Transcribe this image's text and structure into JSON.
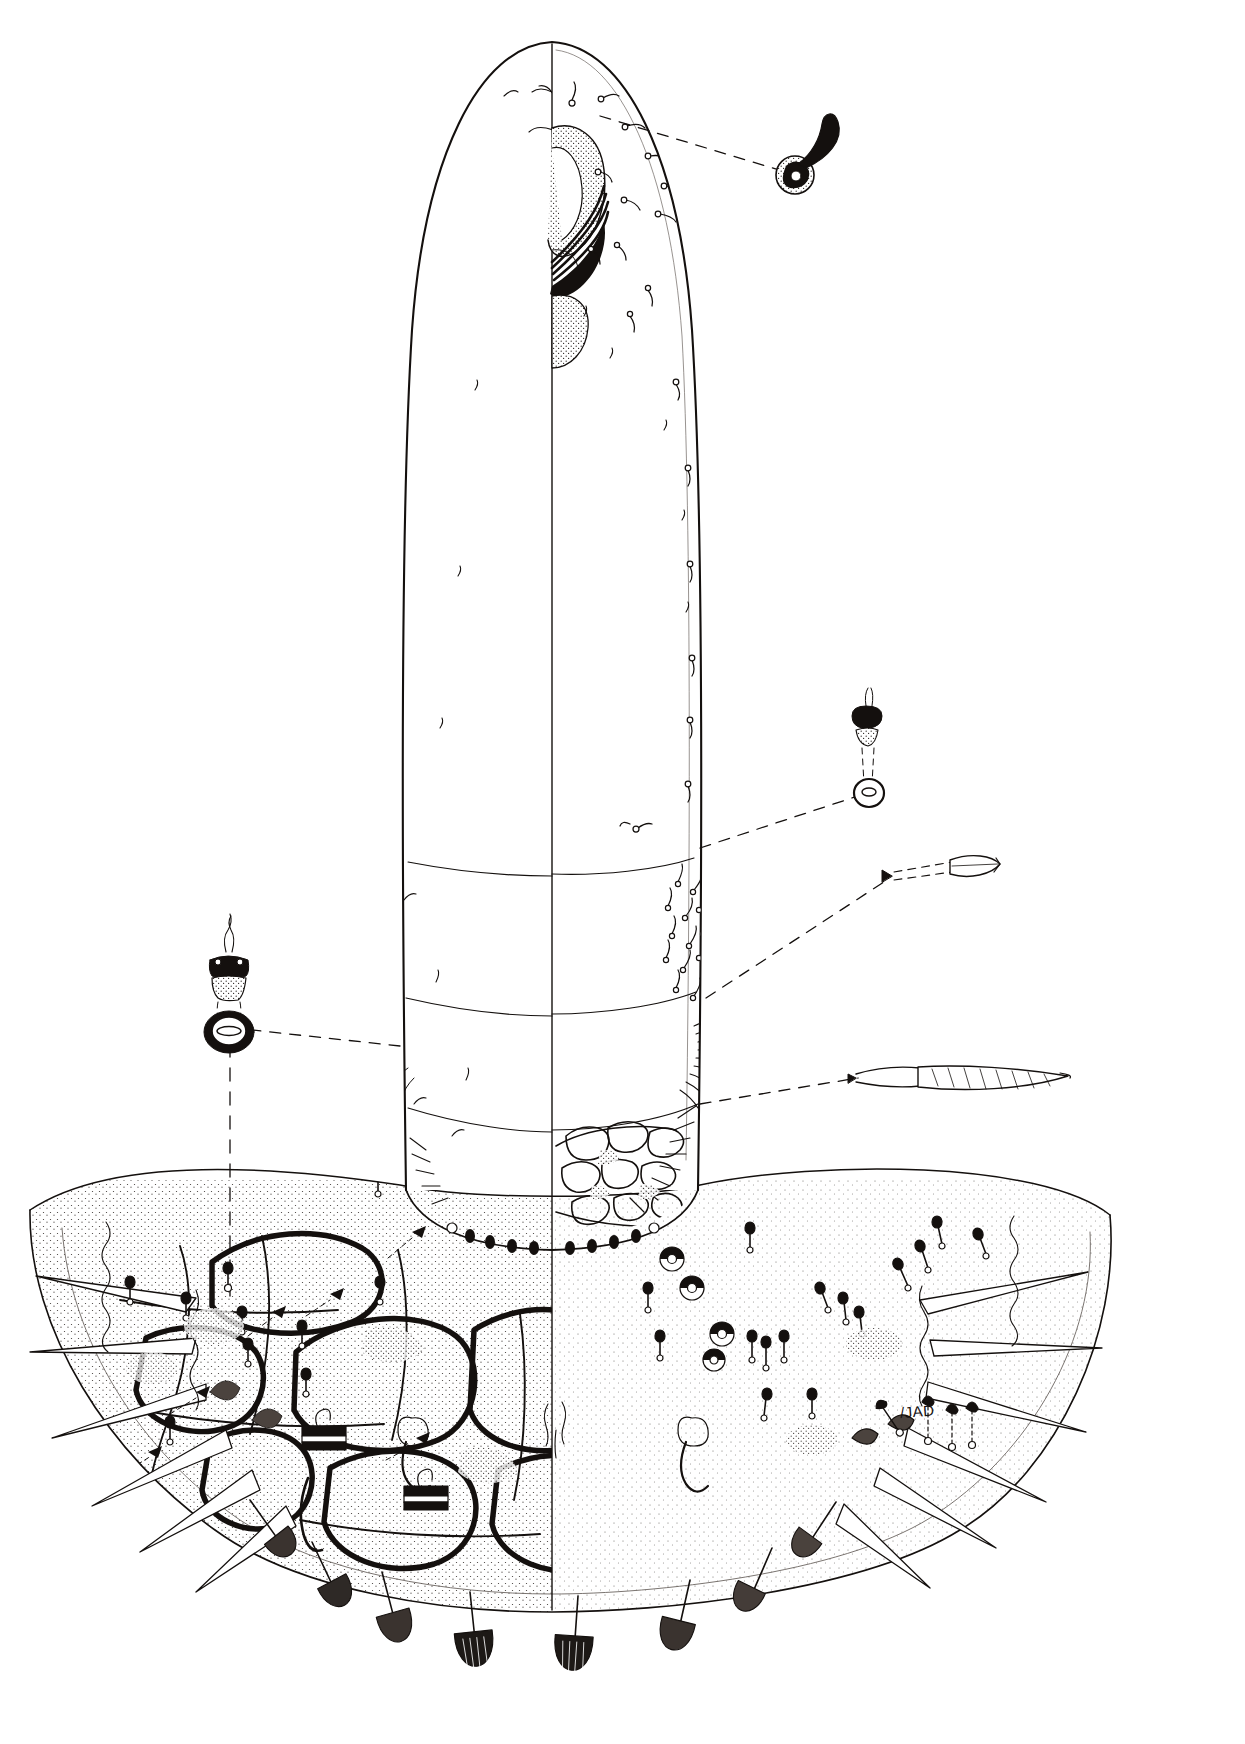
{
  "figure": {
    "domain": "scientific-illustration",
    "medium": "pen-and-ink stipple line drawing",
    "background_color": "#ffffff",
    "ink_color": "#14100e",
    "signature": "/JAD",
    "orientation": "portrait",
    "symmetry": "bilateral, vertical midline at x=552",
    "rendering_convention": {
      "left_half": "outline only in anterior region; reticulate (cell-like) cuticular sculpturing with stipple shading in posterior region",
      "right_half": "punctate cuticle with full complement of setae and alveoli; dense setal field posteriorly"
    }
  },
  "body": {
    "outline_name": "idiosoma-outline",
    "shape": "elongate tongue-shaped dorsal shield, rounded anteriorly, flaring into a broad posterior margin",
    "top_y": 40,
    "bottom_y": 1560,
    "midline_x": 552,
    "neck_width_px": 330,
    "flare_width_px": 1020,
    "segment_creases": [
      {
        "name": "crease-anterior",
        "y": 860
      },
      {
        "name": "crease-mid",
        "y": 1000
      },
      {
        "name": "crease-posterior",
        "y": 1110
      }
    ]
  },
  "gnathosoma": {
    "name": "gnathosoma-chelicerae",
    "description": "stippled cheliceral/capitular complex drawn on the right of the midline near the anterior apex with dark solid stylet blades",
    "x": 552,
    "y": 120,
    "width": 70,
    "height": 190
  },
  "callouts": [
    {
      "id": "callout-apical-seta",
      "label": "apical-seta-enlargement",
      "description": "curved solid-black tapering seta emerging from a stippled annular socket (alveolus)",
      "leader_from": {
        "x": 600,
        "y": 116
      },
      "leader_to": {
        "x": 786,
        "y": 172
      },
      "detail_at": {
        "x": 812,
        "y": 160
      }
    },
    {
      "id": "callout-right-trichobothrium",
      "label": "trichobothrium-and-bothridium-right",
      "description": "dark capitate sensillum above a small ringed bothridium, joined by dashed construction lines",
      "leader_from": {
        "x": 700,
        "y": 845
      },
      "leader_to": {
        "x": 862,
        "y": 795
      },
      "detail_at": {
        "x": 868,
        "y": 760
      }
    },
    {
      "id": "callout-left-trichobothrium",
      "label": "trichobothrium-and-bothridium-left",
      "description": "flask-shaped sensillum with fine filamentous tip above a heavy dark ringed bothridium with a slit-like opening; long vertical dashed tie-line descends to the posterior margin",
      "leader_from": {
        "x": 395,
        "y": 1047
      },
      "leader_to": {
        "x": 252,
        "y": 1030
      },
      "detail_at": {
        "x": 228,
        "y": 990
      }
    },
    {
      "id": "callout-barbed-seta",
      "label": "barbed-lanceolate-seta-enlargement",
      "description": "short stout dashed-outline lanceolate seta with a pointed solid tip",
      "leader_from": {
        "x": 705,
        "y": 995
      },
      "leader_to": {
        "x": 893,
        "y": 878
      },
      "detail_at": {
        "x": 940,
        "y": 872
      }
    },
    {
      "id": "callout-long-seta",
      "label": "long-striated-seta-enlargement",
      "description": "very long finely striated whip-like seta shown lying horizontally",
      "leader_from": {
        "x": 700,
        "y": 1105
      },
      "leader_to": {
        "x": 862,
        "y": 1078
      },
      "detail_at": {
        "x": 960,
        "y": 1080
      }
    }
  ],
  "features": {
    "setae": {
      "name": "dorsal-setae",
      "count_approx": 120,
      "types": [
        "simple curved seta",
        "capitate sensillum",
        "lanceolate barbed seta",
        "long striated seta",
        "minute alveolus"
      ]
    },
    "alveoli": {
      "name": "setal-alveoli",
      "rendering": "small open circles at seta bases"
    },
    "reticulation": {
      "name": "cuticular-reticulation",
      "rendering": "heavy irregular polygonal ridges enclosing stippled areolae",
      "region": "posterior left half"
    },
    "punctation": {
      "name": "cuticular-punctation",
      "rendering": "fine stipple dots",
      "region": "posterior right half"
    },
    "marginal_spines": {
      "name": "marginal-spines",
      "description": "elongate pointed marginal spines projecting from lateral and posterior edges",
      "count_approx": 14
    },
    "marginal_fan_setae": {
      "name": "marginal-fan-setae",
      "description": "broad dark fan- or paddle-shaped setae along the posterior-most margin",
      "count_approx": 10
    },
    "rosette_organs": {
      "name": "rosette-pore-organs",
      "description": "small circular rosette-like pores with radial divisions in the posterior right field",
      "count_approx": 5
    },
    "clasp_organs": {
      "name": "banded-clasp-organs",
      "description": "rectangular dark transversely banded structures on stalks along the posterior ventral margin",
      "count_approx": 4
    }
  },
  "colors": {
    "ink": "#14100e",
    "paper": "#ffffff",
    "stipple": "#3a3430",
    "light_line": "#6b6460"
  }
}
